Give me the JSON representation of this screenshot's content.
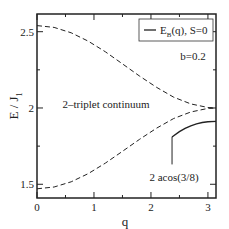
{
  "chart_data": {
    "type": "line",
    "title": "",
    "xlabel": "q",
    "ylabel": "E / J",
    "ylabel_sub": "1",
    "xlim": [
      0,
      3.14159
    ],
    "ylim": [
      1.41,
      2.616
    ],
    "x_ticks": [
      0,
      1,
      2,
      3
    ],
    "x_tick_labels": [
      "0",
      "1",
      "2",
      "3"
    ],
    "y_ticks": [
      1.5,
      2,
      2.5
    ],
    "y_tick_labels": [
      "1.5",
      "2",
      "2.5"
    ],
    "grid": false,
    "legend": {
      "placement": "top-right",
      "entries": [
        {
          "label_main": "E",
          "label_sub": "B",
          "label_rest": "(q), S=0",
          "style": "solid"
        }
      ]
    },
    "series": [
      {
        "name": "continuum-upper",
        "style": "dashed",
        "x": [
          0,
          0.3,
          0.6,
          0.9,
          1.2,
          1.5,
          1.8,
          2.1,
          2.4,
          2.7,
          3.0,
          3.14159
        ],
        "y": [
          2.54,
          2.528,
          2.493,
          2.438,
          2.368,
          2.289,
          2.209,
          2.135,
          2.071,
          2.027,
          2.003,
          2.0
        ]
      },
      {
        "name": "continuum-lower",
        "style": "dashed",
        "x": [
          0,
          0.3,
          0.6,
          0.9,
          1.2,
          1.5,
          1.8,
          2.1,
          2.4,
          2.7,
          3.0,
          3.14159
        ],
        "y": [
          1.47,
          1.482,
          1.516,
          1.57,
          1.639,
          1.716,
          1.795,
          1.868,
          1.931,
          1.974,
          1.997,
          2.0
        ]
      },
      {
        "name": "E_B(q), S=0",
        "style": "solid",
        "x": [
          2.37,
          2.5,
          2.6,
          2.7,
          2.8,
          2.9,
          3.0,
          3.14159
        ],
        "y": [
          1.81,
          1.845,
          1.866,
          1.883,
          1.896,
          1.905,
          1.91,
          1.912
        ]
      }
    ],
    "annotations": [
      {
        "text": "b=0.2",
        "x": 2.85,
        "y": 2.36
      },
      {
        "text": "2–triplet continuum",
        "x": 1.32,
        "y": 2.0
      },
      {
        "text": "2 acos(3/8)",
        "x": 2.78,
        "y": 1.64
      },
      {
        "text": "vertical-marker",
        "x": 2.37,
        "y_range": [
          1.63,
          1.81
        ]
      }
    ]
  }
}
